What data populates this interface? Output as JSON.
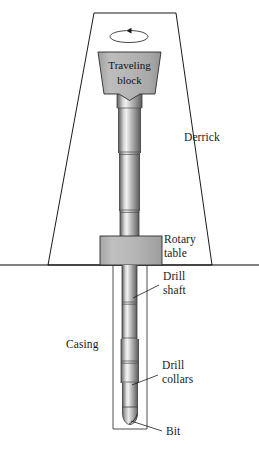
{
  "figure": {
    "background_color": "#ffffff",
    "line_color": "#000000",
    "fill_gray": "#b0b0b0"
  },
  "labels": {
    "derrick": "Derrick",
    "traveling_block_line1": "Traveling",
    "traveling_block_line2": "block",
    "rotary_table_line1": "Rotary",
    "rotary_table_line2": "table",
    "drill_shaft_line1": "Drill",
    "drill_shaft_line2": "shaft",
    "casing": "Casing",
    "drill_collars_line1": "Drill",
    "drill_collars_line2": "collars",
    "bit": "Bit"
  },
  "parts": {
    "derrick": {
      "name": "derrick",
      "shape": "trapezoid-outline",
      "top_width": 86,
      "base_width": 164
    },
    "rotation_arrow": {
      "name": "rotation-arrow",
      "shape": "ellipse-with-arrowhead",
      "direction": "counterclockwise"
    },
    "traveling_block": {
      "name": "traveling-block",
      "shape": "trapezoid-notched-bottom",
      "fill": "#b3b3b3"
    },
    "rotary_table": {
      "name": "rotary-table",
      "shape": "rectangle",
      "fill": "#b5b5b5"
    },
    "drill_shaft": {
      "name": "drill-shaft",
      "shape": "cylinder",
      "joints": 5
    },
    "casing": {
      "name": "casing",
      "shape": "open-top-rectangle-outline"
    },
    "drill_collars": {
      "name": "drill-collars",
      "shape": "cylinder-wide"
    },
    "bit": {
      "name": "bit",
      "shape": "rounded-taper"
    },
    "ground_line": {
      "name": "ground-line",
      "shape": "horizontal-rule"
    }
  }
}
